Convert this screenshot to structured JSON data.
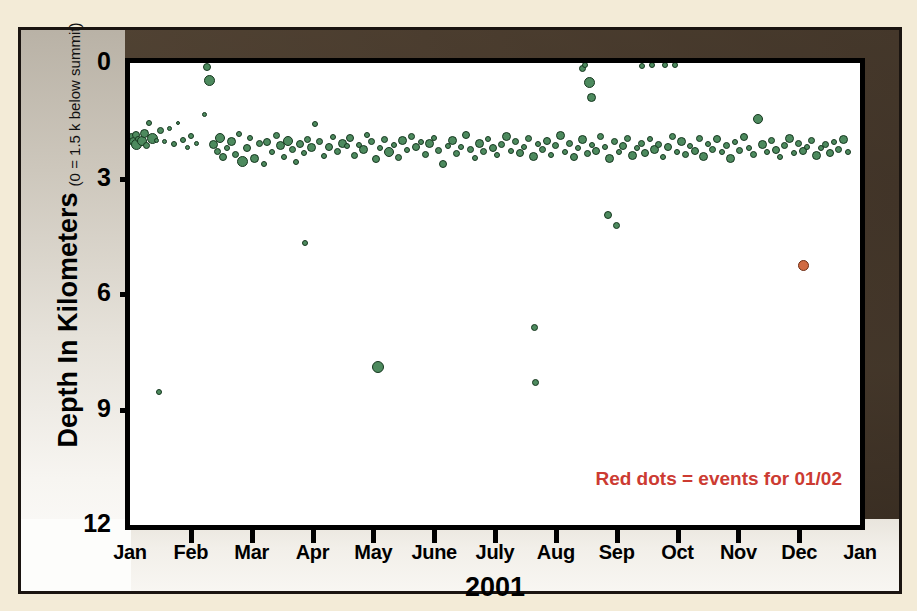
{
  "figure": {
    "legend_note": "Red dots = events for 01/02",
    "legend_color": "#cc3b32",
    "frame_color": "#1a1410",
    "mat_color": "#87796a"
  },
  "chart_data": {
    "type": "scatter",
    "title": "",
    "xlabel": "2001",
    "ylabel": "Depth In Kilometers",
    "ylabel_sub": "(0 = 1.5 k below summit)",
    "xticklabels": [
      "Jan",
      "Feb",
      "Mar",
      "Apr",
      "May",
      "June",
      "July",
      "Aug",
      "Sep",
      "Oct",
      "Nov",
      "Dec",
      "Jan"
    ],
    "yticklabels": [
      "0",
      "3",
      "6",
      "9",
      "12"
    ],
    "ytickvalues": [
      0,
      3,
      6,
      9,
      12
    ],
    "ylim": [
      0,
      12
    ],
    "y_inverted": true,
    "xlim": [
      0,
      13
    ],
    "grid": false,
    "legend_position": "bottom-right",
    "series": [
      {
        "name": "events for 2001",
        "color": "#4d8a5e",
        "edgecolor": "#16371f",
        "points": [
          [
            0.03,
            1.9,
            7
          ],
          [
            0.06,
            2.05,
            9
          ],
          [
            0.1,
            1.88,
            8
          ],
          [
            0.12,
            2.12,
            11
          ],
          [
            0.14,
            1.98,
            6
          ],
          [
            0.22,
            2.02,
            10
          ],
          [
            0.26,
            1.82,
            9
          ],
          [
            0.3,
            2.15,
            7
          ],
          [
            0.34,
            1.55,
            6
          ],
          [
            0.4,
            1.95,
            11
          ],
          [
            0.48,
            2.0,
            5
          ],
          [
            0.55,
            1.75,
            7
          ],
          [
            0.62,
            2.05,
            5
          ],
          [
            0.7,
            1.7,
            5
          ],
          [
            0.78,
            2.1,
            6
          ],
          [
            0.85,
            1.55,
            4
          ],
          [
            0.52,
            8.55,
            6
          ],
          [
            0.95,
            2.0,
            6
          ],
          [
            1.02,
            2.2,
            5
          ],
          [
            1.08,
            1.9,
            6
          ],
          [
            1.18,
            2.08,
            5
          ],
          [
            1.32,
            1.35,
            5
          ],
          [
            1.38,
            0.1,
            8
          ],
          [
            1.42,
            0.45,
            11
          ],
          [
            1.48,
            2.12,
            9
          ],
          [
            1.55,
            2.3,
            7
          ],
          [
            1.6,
            1.95,
            10
          ],
          [
            1.66,
            2.45,
            8
          ],
          [
            1.72,
            2.2,
            6
          ],
          [
            1.8,
            2.05,
            9
          ],
          [
            1.88,
            2.38,
            7
          ],
          [
            1.94,
            1.85,
            6
          ],
          [
            2.0,
            2.55,
            11
          ],
          [
            2.08,
            2.2,
            8
          ],
          [
            2.14,
            1.95,
            6
          ],
          [
            2.22,
            2.48,
            9
          ],
          [
            2.3,
            2.1,
            7
          ],
          [
            2.38,
            2.62,
            6
          ],
          [
            2.44,
            2.05,
            8
          ],
          [
            2.52,
            2.3,
            6
          ],
          [
            2.6,
            1.88,
            7
          ],
          [
            2.68,
            2.15,
            9
          ],
          [
            2.74,
            2.45,
            6
          ],
          [
            2.82,
            2.02,
            10
          ],
          [
            2.9,
            2.25,
            7
          ],
          [
            2.96,
            2.58,
            6
          ],
          [
            3.02,
            2.1,
            8
          ],
          [
            3.1,
            2.35,
            6
          ],
          [
            3.16,
            1.98,
            7
          ],
          [
            3.24,
            2.2,
            9
          ],
          [
            3.3,
            1.58,
            6
          ],
          [
            3.38,
            2.05,
            7
          ],
          [
            3.46,
            2.42,
            6
          ],
          [
            3.54,
            2.18,
            8
          ],
          [
            3.62,
            1.92,
            6
          ],
          [
            3.7,
            2.3,
            7
          ],
          [
            3.78,
            2.08,
            9
          ],
          [
            3.12,
            4.68,
            6
          ],
          [
            3.86,
            2.15,
            6
          ],
          [
            3.92,
            1.95,
            8
          ],
          [
            4.0,
            2.4,
            7
          ],
          [
            4.08,
            2.12,
            6
          ],
          [
            4.16,
            2.25,
            9
          ],
          [
            4.22,
            1.88,
            6
          ],
          [
            4.3,
            2.05,
            7
          ],
          [
            4.38,
            2.5,
            8
          ],
          [
            4.46,
            2.2,
            6
          ],
          [
            4.54,
            1.98,
            7
          ],
          [
            4.62,
            2.32,
            10
          ],
          [
            4.7,
            2.12,
            6
          ],
          [
            4.78,
            2.45,
            7
          ],
          [
            4.86,
            2.02,
            9
          ],
          [
            4.94,
            2.25,
            6
          ],
          [
            5.02,
            1.9,
            7
          ],
          [
            4.42,
            7.9,
            12
          ],
          [
            5.1,
            2.18,
            8
          ],
          [
            5.18,
            2.05,
            6
          ],
          [
            5.26,
            2.38,
            7
          ],
          [
            5.34,
            2.1,
            9
          ],
          [
            5.42,
            1.95,
            6
          ],
          [
            5.5,
            2.28,
            7
          ],
          [
            5.58,
            2.62,
            8
          ],
          [
            5.66,
            2.15,
            6
          ],
          [
            5.74,
            2.02,
            9
          ],
          [
            5.82,
            2.35,
            7
          ],
          [
            5.9,
            2.18,
            6
          ],
          [
            5.98,
            1.88,
            8
          ],
          [
            6.06,
            2.25,
            7
          ],
          [
            6.14,
            2.48,
            6
          ],
          [
            6.22,
            2.08,
            9
          ],
          [
            6.3,
            2.3,
            7
          ],
          [
            6.38,
            1.98,
            6
          ],
          [
            6.46,
            2.22,
            8
          ],
          [
            6.54,
            2.4,
            6
          ],
          [
            6.62,
            2.12,
            7
          ],
          [
            6.7,
            1.9,
            9
          ],
          [
            6.78,
            2.28,
            6
          ],
          [
            6.86,
            2.05,
            7
          ],
          [
            6.94,
            2.35,
            8
          ],
          [
            7.02,
            2.18,
            6
          ],
          [
            7.1,
            1.95,
            7
          ],
          [
            7.18,
            2.42,
            9
          ],
          [
            7.26,
            2.1,
            6
          ],
          [
            7.34,
            2.25,
            7
          ],
          [
            7.42,
            2.02,
            8
          ],
          [
            7.5,
            2.38,
            6
          ],
          [
            7.58,
            2.15,
            7
          ],
          [
            7.66,
            1.88,
            9
          ],
          [
            7.74,
            2.3,
            6
          ],
          [
            7.82,
            2.08,
            7
          ],
          [
            7.9,
            2.45,
            8
          ],
          [
            7.2,
            6.88,
            7
          ],
          [
            7.22,
            8.3,
            7
          ],
          [
            7.98,
            2.2,
            6
          ],
          [
            8.06,
            1.98,
            9
          ],
          [
            8.14,
            2.35,
            7
          ],
          [
            8.22,
            2.12,
            6
          ],
          [
            8.3,
            2.28,
            8
          ],
          [
            8.38,
            1.92,
            7
          ],
          [
            8.46,
            2.18,
            6
          ],
          [
            8.54,
            2.48,
            9
          ],
          [
            8.05,
            0.15,
            7
          ],
          [
            8.18,
            0.5,
            11
          ],
          [
            8.22,
            0.9,
            9
          ],
          [
            8.1,
            0.05,
            6
          ],
          [
            8.62,
            2.05,
            7
          ],
          [
            8.7,
            2.32,
            6
          ],
          [
            8.78,
            2.15,
            8
          ],
          [
            8.86,
            1.95,
            7
          ],
          [
            8.94,
            2.4,
            9
          ],
          [
            9.02,
            2.22,
            6
          ],
          [
            9.1,
            2.08,
            7
          ],
          [
            9.18,
            2.35,
            8
          ],
          [
            8.52,
            3.95,
            8
          ],
          [
            8.66,
            4.22,
            7
          ],
          [
            9.26,
            1.98,
            6
          ],
          [
            9.34,
            2.25,
            9
          ],
          [
            9.42,
            2.12,
            7
          ],
          [
            9.5,
            2.45,
            6
          ],
          [
            9.58,
            2.18,
            8
          ],
          [
            9.66,
            1.9,
            7
          ],
          [
            9.74,
            2.3,
            6
          ],
          [
            9.82,
            2.05,
            9
          ],
          [
            9.9,
            2.38,
            7
          ],
          [
            9.98,
            2.15,
            6
          ],
          [
            10.06,
            2.28,
            8
          ],
          [
            10.14,
            1.95,
            7
          ],
          [
            9.12,
            0.08,
            6
          ],
          [
            9.3,
            0.05,
            6
          ],
          [
            9.52,
            0.06,
            6
          ],
          [
            9.7,
            0.05,
            6
          ],
          [
            10.22,
            2.42,
            9
          ],
          [
            10.3,
            2.1,
            6
          ],
          [
            10.38,
            2.25,
            7
          ],
          [
            10.46,
            1.98,
            8
          ],
          [
            10.54,
            2.32,
            6
          ],
          [
            10.62,
            2.15,
            7
          ],
          [
            10.7,
            2.48,
            9
          ],
          [
            10.78,
            2.05,
            6
          ],
          [
            10.86,
            2.28,
            7
          ],
          [
            10.94,
            1.92,
            8
          ],
          [
            11.02,
            2.2,
            6
          ],
          [
            11.1,
            2.38,
            7
          ],
          [
            11.18,
            1.45,
            10
          ],
          [
            11.26,
            2.12,
            9
          ],
          [
            11.34,
            2.3,
            6
          ],
          [
            11.42,
            2.02,
            7
          ],
          [
            11.5,
            2.25,
            8
          ],
          [
            11.58,
            2.45,
            6
          ],
          [
            11.66,
            2.15,
            7
          ],
          [
            11.74,
            1.95,
            9
          ],
          [
            11.82,
            2.35,
            6
          ],
          [
            11.9,
            2.08,
            7
          ],
          [
            11.98,
            2.28,
            8
          ],
          [
            12.06,
            2.18,
            6
          ],
          [
            12.14,
            2.02,
            7
          ],
          [
            12.22,
            2.4,
            9
          ],
          [
            12.3,
            2.22,
            6
          ],
          [
            12.38,
            2.12,
            7
          ],
          [
            12.46,
            2.35,
            8
          ],
          [
            12.54,
            2.05,
            6
          ],
          [
            12.62,
            2.25,
            7
          ],
          [
            12.7,
            1.98,
            9
          ],
          [
            12.78,
            2.3,
            6
          ]
        ]
      },
      {
        "name": "events for 01/02",
        "color": "#d06a42",
        "edgecolor": "#6e2d14",
        "points": [
          [
            12.0,
            5.25,
            11
          ]
        ]
      }
    ]
  }
}
